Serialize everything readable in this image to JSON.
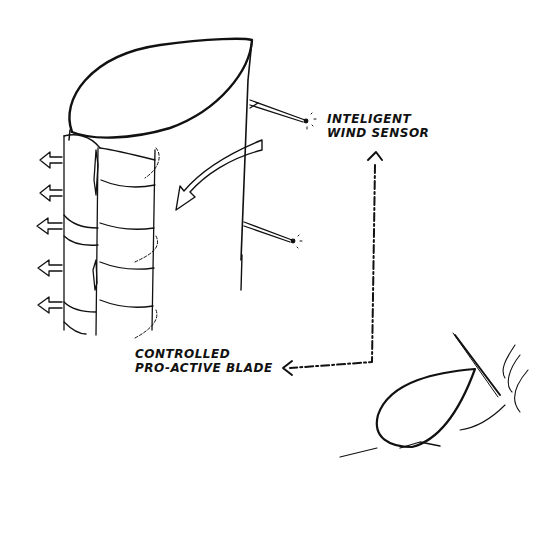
{
  "diagram": {
    "labels": {
      "sensor_line1": "INTELIGENT",
      "sensor_line2": "WIND SENSOR",
      "blade_line1": "CONTROLLED",
      "blade_line2": "PRO-ACTIVE BLADE"
    },
    "colors": {
      "ink": "#111111",
      "background": "#ffffff"
    }
  }
}
